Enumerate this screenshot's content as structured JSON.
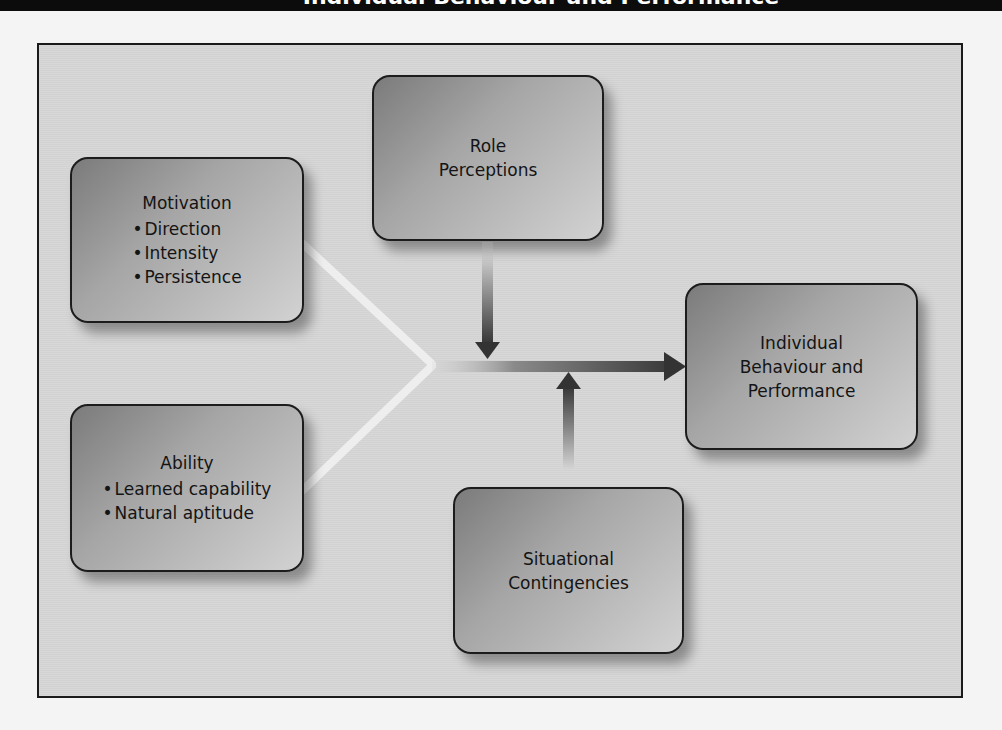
{
  "title_bar": {
    "title": "Individual Behaviour and Performance"
  },
  "diagram": {
    "type": "conceptual-model",
    "boxes": {
      "motivation": {
        "heading": "Motivation",
        "items": [
          "Direction",
          "Intensity",
          "Persistence"
        ]
      },
      "ability": {
        "heading": "Ability",
        "items": [
          "Learned capability",
          "Natural aptitude"
        ]
      },
      "role_perceptions": {
        "lines": [
          "Role",
          "Perceptions"
        ]
      },
      "situational_contingencies": {
        "lines": [
          "Situational",
          "Contingencies"
        ]
      },
      "outcome": {
        "lines": [
          "Individual",
          "Behaviour and",
          "Performance"
        ]
      }
    },
    "bullet": "•",
    "edges": [
      {
        "from": "Motivation",
        "to": "Individual Behaviour and Performance",
        "style": "light converging line"
      },
      {
        "from": "Ability",
        "to": "Individual Behaviour and Performance",
        "style": "light converging line"
      },
      {
        "from": "Role Perceptions",
        "to": "main arrow",
        "style": "down arrow"
      },
      {
        "from": "Situational Contingencies",
        "to": "main arrow",
        "style": "up arrow"
      }
    ],
    "colors": {
      "box_dark": "#7b7b7b",
      "box_light": "#d2d2d2",
      "frame_bg": "#d6d6d6",
      "border": "#1c1c1c",
      "arrow": "#3a3a3a"
    }
  }
}
